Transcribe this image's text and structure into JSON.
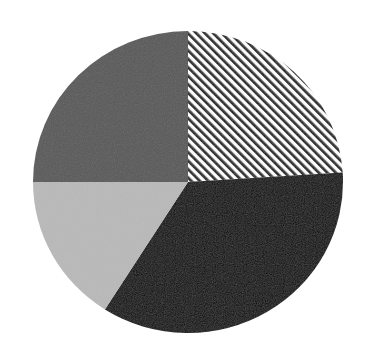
{
  "chart_data": {
    "type": "pie",
    "title": "",
    "start_angle_deg": 90,
    "direction": "clockwise",
    "slices": [
      {
        "label": "",
        "value": 24,
        "fill": "hatch",
        "color": "#1a1a1a"
      },
      {
        "label": "",
        "value": 35,
        "fill": "solid",
        "color": "#050505"
      },
      {
        "label": "",
        "value": 16,
        "fill": "solid",
        "color": "#b9b9b9"
      },
      {
        "label": "",
        "value": 25,
        "fill": "solid",
        "color": "#585858"
      }
    ],
    "legend": null,
    "center": [
      188,
      182
    ],
    "radius": [
      155,
      151
    ]
  }
}
